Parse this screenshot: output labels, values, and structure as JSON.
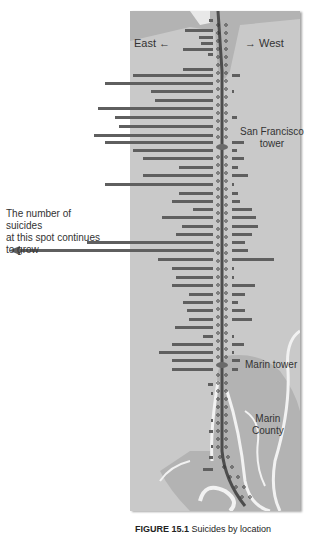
{
  "labels": {
    "east": "East",
    "west": "West",
    "sf_tower": [
      "San Francisco",
      "tower"
    ],
    "marin_tower": "Marin tower",
    "marin_county": [
      "Marin",
      "County"
    ],
    "note": [
      "The number of suicides",
      "at this spot continues",
      "to grow"
    ],
    "caption_bold": "FIGURE 15.1",
    "caption_rest": " Suicides by location"
  },
  "colors": {
    "panel": "#c9c9c9",
    "land": "#b3b3b3",
    "bar": "#5f5f5f",
    "road": "#f2f2f2",
    "bridge": "#4d4d4d"
  },
  "chart_data": {
    "type": "bar",
    "orientation": "horizontal-diverging",
    "xlabel": "East ← → West",
    "ylabel": "Position along bridge (San Francisco top, Marin bottom)",
    "annotations": [
      "San Francisco tower",
      "Marin tower",
      "Marin County",
      "The number of suicides at this spot continues to grow"
    ],
    "rows": [
      {
        "y": 20,
        "east": 4,
        "west": 0
      },
      {
        "y": 30,
        "east": 28,
        "west": 0
      },
      {
        "y": 37,
        "east": 14,
        "west": 0
      },
      {
        "y": 43,
        "east": 12,
        "west": 0
      },
      {
        "y": 49,
        "east": 30,
        "west": 0
      },
      {
        "y": 54,
        "east": 5,
        "west": 0
      },
      {
        "y": 69,
        "east": 30,
        "west": 0
      },
      {
        "y": 75,
        "east": 80,
        "west": 8
      },
      {
        "y": 83,
        "east": 108,
        "west": 0
      },
      {
        "y": 91,
        "east": 62,
        "west": 2
      },
      {
        "y": 100,
        "east": 58,
        "west": 0
      },
      {
        "y": 108,
        "east": 115,
        "west": 0
      },
      {
        "y": 117,
        "east": 98,
        "west": 5
      },
      {
        "y": 126,
        "east": 94,
        "west": 0
      },
      {
        "y": 135,
        "east": 119,
        "west": 0
      },
      {
        "y": 142,
        "east": 108,
        "west": 12
      },
      {
        "y": 150,
        "east": 80,
        "west": 5
      },
      {
        "y": 158,
        "east": 70,
        "west": 12
      },
      {
        "y": 167,
        "east": 34,
        "west": 6
      },
      {
        "y": 175,
        "east": 70,
        "west": 16
      },
      {
        "y": 184,
        "east": 108,
        "west": 2
      },
      {
        "y": 193,
        "east": 34,
        "west": 6
      },
      {
        "y": 201,
        "east": 41,
        "west": 8
      },
      {
        "y": 209,
        "east": 20,
        "west": 20
      },
      {
        "y": 217,
        "east": 51,
        "west": 24
      },
      {
        "y": 226,
        "east": 31,
        "west": 26
      },
      {
        "y": 234,
        "east": 37,
        "west": 20
      },
      {
        "y": 242,
        "east": 126,
        "west": 13
      },
      {
        "y": 250,
        "east": 200,
        "west": 16
      },
      {
        "y": 259,
        "east": 55,
        "west": 42
      },
      {
        "y": 268,
        "east": 41,
        "west": 2
      },
      {
        "y": 277,
        "east": 37,
        "west": 2
      },
      {
        "y": 285,
        "east": 41,
        "west": 23
      },
      {
        "y": 294,
        "east": 24,
        "west": 13
      },
      {
        "y": 302,
        "east": 30,
        "west": 6
      },
      {
        "y": 310,
        "east": 26,
        "west": 13
      },
      {
        "y": 319,
        "east": 24,
        "west": 20
      },
      {
        "y": 327,
        "east": 38,
        "west": 0
      },
      {
        "y": 336,
        "east": 10,
        "west": 2
      },
      {
        "y": 344,
        "east": 41,
        "west": 12
      },
      {
        "y": 352,
        "east": 54,
        "west": 2
      },
      {
        "y": 360,
        "east": 41,
        "west": 8
      },
      {
        "y": 369,
        "east": 41,
        "west": 6
      },
      {
        "y": 384,
        "east": 5,
        "west": 0
      },
      {
        "y": 393,
        "east": 2,
        "west": 0
      },
      {
        "y": 420,
        "east": 2,
        "west": 0
      },
      {
        "y": 431,
        "east": 4,
        "west": 0
      },
      {
        "y": 446,
        "east": 2,
        "west": 0
      },
      {
        "y": 457,
        "east": 4,
        "west": 0
      },
      {
        "y": 469,
        "east": 10,
        "west": 0
      }
    ]
  }
}
